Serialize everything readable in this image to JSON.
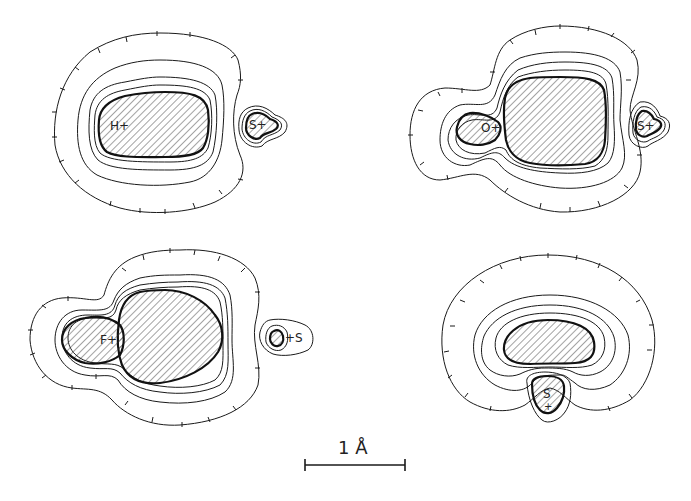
{
  "figure": {
    "panels": [
      {
        "id": "HS",
        "labels": {
          "atom1": "H+",
          "atom2": "S+"
        }
      },
      {
        "id": "OS",
        "labels": {
          "atom1": "O+",
          "atom2": "S+"
        }
      },
      {
        "id": "FS",
        "labels": {
          "atom1": "F+",
          "atom2": "+S"
        }
      },
      {
        "id": "S",
        "labels": {
          "atom1": "S",
          "atom1_marker": "+"
        }
      }
    ],
    "scale_bar": {
      "label": "1 Å",
      "length_px": 100
    },
    "colors": {
      "line": "#1a1a1a",
      "background": "#ffffff",
      "hatch": "#333333"
    }
  }
}
